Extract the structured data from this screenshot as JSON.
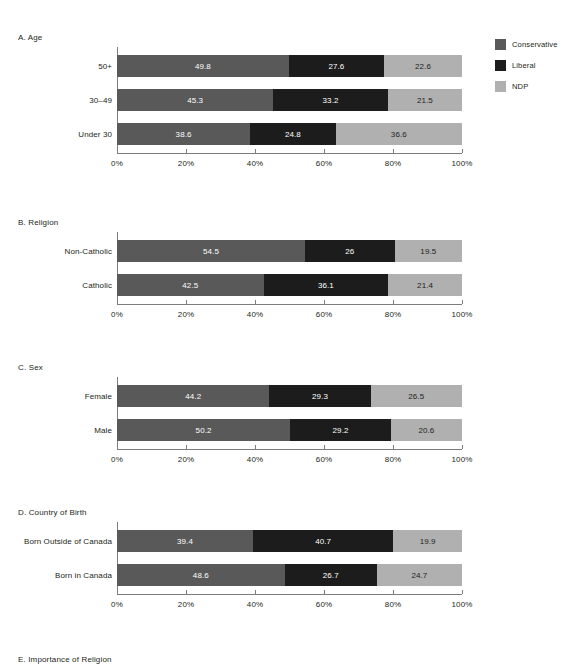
{
  "legend": {
    "position": "top-right",
    "items": [
      {
        "label": "Conservative",
        "color": "#595959",
        "swatch_name": "legend-swatch-conservative"
      },
      {
        "label": "Liberal",
        "color": "#1c1c1c",
        "swatch_name": "legend-swatch-liberal"
      },
      {
        "label": "NDP",
        "color": "#b0b0b0",
        "swatch_name": "legend-swatch-ndp"
      }
    ]
  },
  "axis": {
    "ticks": [
      "0%",
      "20%",
      "40%",
      "60%",
      "80%",
      "100%"
    ],
    "tick_values": [
      0,
      20,
      40,
      60,
      80,
      100
    ],
    "min": 0,
    "max": 100
  },
  "panels": [
    {
      "id": "A",
      "title": "A. Age",
      "rows": [
        {
          "label": "50+",
          "values": [
            49.8,
            27.6,
            22.6
          ],
          "labels": [
            "49.8",
            "27.6",
            "22.6"
          ]
        },
        {
          "label": "30–49",
          "values": [
            45.3,
            33.2,
            21.5
          ],
          "labels": [
            "45.3",
            "33.2",
            "21.5"
          ]
        },
        {
          "label": "Under 30",
          "values": [
            38.6,
            24.8,
            36.6
          ],
          "labels": [
            "38.6",
            "24.8",
            "36.6"
          ]
        }
      ]
    },
    {
      "id": "B",
      "title": "B. Religion",
      "rows": [
        {
          "label": "Non-Catholic",
          "values": [
            54.5,
            26.0,
            19.5
          ],
          "labels": [
            "54.5",
            "26",
            "19.5"
          ]
        },
        {
          "label": "Catholic",
          "values": [
            42.5,
            36.1,
            21.4
          ],
          "labels": [
            "42.5",
            "36.1",
            "21.4"
          ]
        }
      ]
    },
    {
      "id": "C",
      "title": "C. Sex",
      "rows": [
        {
          "label": "Female",
          "values": [
            44.2,
            29.3,
            26.5
          ],
          "labels": [
            "44.2",
            "29.3",
            "26.5"
          ]
        },
        {
          "label": "Male",
          "values": [
            50.2,
            29.2,
            20.6
          ],
          "labels": [
            "50.2",
            "29.2",
            "20.6"
          ]
        }
      ]
    },
    {
      "id": "D",
      "title": "D. Country of Birth",
      "rows": [
        {
          "label": "Born Outside of Canada",
          "values": [
            39.4,
            40.7,
            19.9
          ],
          "labels": [
            "39.4",
            "40.7",
            "19.9"
          ]
        },
        {
          "label": "Born in Canada",
          "values": [
            48.6,
            26.7,
            24.7
          ],
          "labels": [
            "48.6",
            "26.7",
            "24.7"
          ]
        }
      ]
    },
    {
      "id": "E",
      "title": "E.   Importance of Religion",
      "rows": []
    }
  ],
  "chart_data": {
    "type": "bar",
    "title": "",
    "subtitle": "",
    "orientation": "horizontal",
    "stacked": true,
    "normalized": "100% stacked",
    "xlabel": "",
    "ylabel": "",
    "xlim": [
      0,
      100
    ],
    "xticks": [
      0,
      20,
      40,
      60,
      80,
      100
    ],
    "xticklabels": [
      "0%",
      "20%",
      "40%",
      "60%",
      "80%",
      "100%"
    ],
    "grid": false,
    "legend": [
      "Conservative",
      "Liberal",
      "NDP"
    ],
    "legend_position": "top-right",
    "series_colors": [
      "#595959",
      "#1c1c1c",
      "#b0b0b0"
    ],
    "panels": [
      {
        "panel": "A. Age",
        "categories": [
          "50+",
          "30–49",
          "Under 30"
        ],
        "series": [
          {
            "name": "Conservative",
            "values": [
              49.8,
              45.3,
              38.6
            ]
          },
          {
            "name": "Liberal",
            "values": [
              27.6,
              33.2,
              24.8
            ]
          },
          {
            "name": "NDP",
            "values": [
              22.6,
              21.5,
              36.6
            ]
          }
        ]
      },
      {
        "panel": "B. Religion",
        "categories": [
          "Non-Catholic",
          "Catholic"
        ],
        "series": [
          {
            "name": "Conservative",
            "values": [
              54.5,
              42.5
            ]
          },
          {
            "name": "Liberal",
            "values": [
              26.0,
              36.1
            ]
          },
          {
            "name": "NDP",
            "values": [
              19.5,
              21.4
            ]
          }
        ]
      },
      {
        "panel": "C. Sex",
        "categories": [
          "Female",
          "Male"
        ],
        "series": [
          {
            "name": "Conservative",
            "values": [
              44.2,
              50.2
            ]
          },
          {
            "name": "Liberal",
            "values": [
              29.3,
              29.2
            ]
          },
          {
            "name": "NDP",
            "values": [
              26.5,
              20.6
            ]
          }
        ]
      },
      {
        "panel": "D. Country of Birth",
        "categories": [
          "Born Outside of Canada",
          "Born in Canada"
        ],
        "series": [
          {
            "name": "Conservative",
            "values": [
              39.4,
              48.6
            ]
          },
          {
            "name": "Liberal",
            "values": [
              40.7,
              26.7
            ]
          },
          {
            "name": "NDP",
            "values": [
              19.9,
              24.7
            ]
          }
        ]
      },
      {
        "panel": "E. Importance of Religion",
        "categories": [],
        "series": [],
        "note": "panel cut off at bottom of image — title only"
      }
    ]
  }
}
